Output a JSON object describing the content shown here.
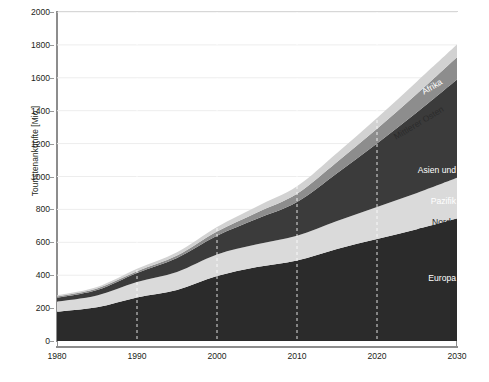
{
  "chart_data": {
    "type": "area",
    "stacked": true,
    "title": "",
    "xlabel": "",
    "ylabel": "Touristenankünfte [Mio.]",
    "xlim": [
      1980,
      2030
    ],
    "ylim": [
      0,
      2000
    ],
    "ytick_step": 200,
    "yticks": [
      "2000",
      "1800",
      "1600",
      "1400",
      "1200",
      "1000",
      "800",
      "600",
      "400",
      "200",
      "0"
    ],
    "xticks": [
      "1980",
      "1990",
      "2000",
      "2010",
      "2020",
      "2030"
    ],
    "grid": "horizontal light + vertical white dashed at decades",
    "legend": "inline labels inside bands",
    "x": [
      1980,
      1985,
      1990,
      1995,
      2000,
      2005,
      2010,
      2015,
      2020,
      2025,
      2030
    ],
    "series": [
      {
        "name": "Europa",
        "color": "#2b2b2b",
        "values": [
          178,
          205,
          265,
          310,
          395,
          450,
          490,
          560,
          620,
          680,
          744
        ]
      },
      {
        "name": "Nord-, Lateinamerika",
        "color": "#dadada",
        "values": [
          62,
          72,
          93,
          110,
          131,
          138,
          150,
          170,
          195,
          220,
          248
        ]
      },
      {
        "name": "Asien und Pazifik",
        "color": "#3b3b3b",
        "values": [
          23,
          33,
          56,
          85,
          114,
          155,
          205,
          290,
          385,
          490,
          597
        ]
      },
      {
        "name": "Mittlerer Osten",
        "color": "#8d8d8d",
        "values": [
          7,
          9,
          10,
          14,
          25,
          38,
          50,
          68,
          90,
          113,
          136
        ]
      },
      {
        "name": "Afrika",
        "color": "#d2d2d2",
        "values": [
          7,
          9,
          15,
          20,
          28,
          37,
          45,
          55,
          65,
          75,
          77
        ]
      }
    ],
    "totals": [
      277,
      328,
      439,
      539,
      693,
      818,
      940,
      1143,
      1355,
      1578,
      1802
    ]
  },
  "labels": {
    "afrika": "Afrika",
    "mittlerer_osten": "Mittlerer Osten",
    "asien_1": "Asien und",
    "asien_2": "Pazifik",
    "amerika_1": "Nord-,",
    "amerika_2": "Lateinamerika",
    "europa": "Europa"
  },
  "colors": {
    "europa": "#2b2b2b",
    "amerika": "#dadada",
    "asien": "#3b3b3b",
    "osten": "#8d8d8d",
    "afrika": "#d2d2d2",
    "axis": "#8d8d8d",
    "grid": "#ededed",
    "text": "#231f20",
    "background": "#ffffff"
  }
}
